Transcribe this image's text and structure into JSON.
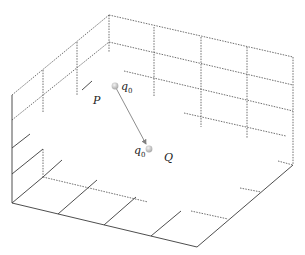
{
  "diagram": {
    "points": [
      {
        "id": "P",
        "label": "P",
        "charge": {
          "symbol": "q",
          "subscript": "0"
        }
      },
      {
        "id": "Q",
        "label": "Q",
        "charge": {
          "symbol": "q",
          "subscript": "0"
        }
      }
    ],
    "arrow": {
      "from": "P",
      "to": "Q"
    },
    "colors": {
      "frame": "#3a3a3a",
      "grid": "#4a4a4a",
      "arrow": "#808080",
      "charge": "#c8c8c8"
    }
  },
  "labels": {
    "P": "P",
    "Q": "Q",
    "q_top_symbol": "q",
    "q_top_sub": "0",
    "q_bottom_symbol": "q",
    "q_bottom_sub": "0"
  }
}
